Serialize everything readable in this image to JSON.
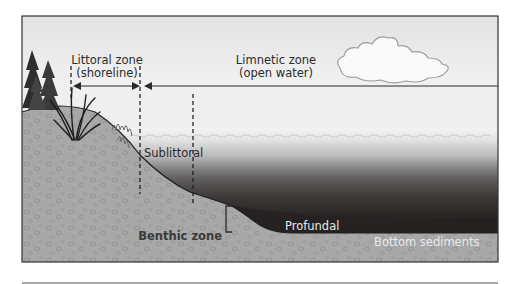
{
  "diagram": {
    "labels": {
      "littoral_line1": "Littoral zone",
      "littoral_line2": "(shoreline)",
      "limnetic_line1": "Limnetic zone",
      "limnetic_line2": "(open water)",
      "sublittoral": "Sublittoral",
      "profundal": "Profundal",
      "benthic": "Benthic zone",
      "bottom_sediments": "Bottom sediments"
    },
    "icons": {
      "cloud": "cloud-icon",
      "trees": "tree-icon",
      "reeds": "reed-plant-icon"
    },
    "colors": {
      "sky": "#ebebeb",
      "frame": "#333333",
      "soil": "#a9a9a9",
      "water_surface": "#f2f2f2",
      "water_deep": "#2a2626",
      "label_dark": "#2b2b2b",
      "label_light": "#e8e8ea"
    }
  }
}
